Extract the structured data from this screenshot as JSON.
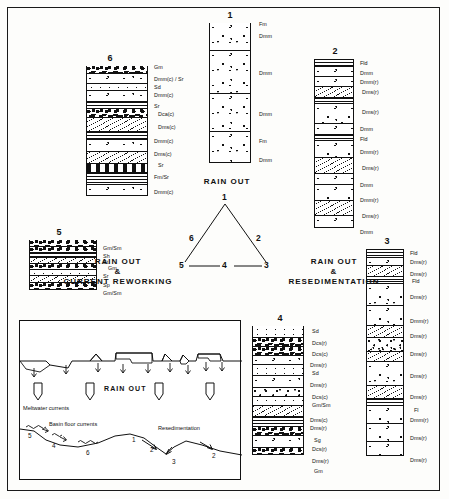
{
  "figure": {
    "title_visible": false
  },
  "columns": [
    {
      "id": "col1",
      "number": "1",
      "labels": [
        "Fm",
        "Dmm",
        "Dmm",
        "Dmm",
        "Fm",
        "Dmm"
      ]
    },
    {
      "id": "col2",
      "number": "2",
      "labels": [
        "Fld",
        "Dmm",
        "Dmm(r)",
        "Dms(r)",
        "Dms(r)",
        "Dmm",
        "Fld",
        "Dmm(r)",
        "Dms(r)",
        "Dmm",
        "Dmm(r)",
        "Dms(r)",
        "Dmm"
      ]
    },
    {
      "id": "col3",
      "number": "3",
      "labels": [
        "Fld",
        "Dms(r)",
        "Dms(r)",
        "Fld",
        "Dms(r)",
        "Dmm(r)",
        "Dms(r)",
        "Dms(r)",
        "Dms(r)",
        "Dms(r)",
        "Fl",
        "Dmm(r)",
        "Dms(r)",
        "Dms(r)"
      ]
    },
    {
      "id": "col4",
      "number": "4",
      "labels": [
        "Sd",
        "Dcs(r)",
        "Dcs(c)",
        "Dms(r)",
        "Sd",
        "Dms(r)",
        "Dcs(c)",
        "Gm/Sm",
        "Dms(c)",
        "Dms(r)",
        "Sg",
        "Dcs(r)",
        "Dms(r)",
        "Gm"
      ]
    },
    {
      "id": "col5",
      "number": "5",
      "labels": [
        "Gm/Sm",
        "Sh",
        "St",
        "Gm",
        "Sr",
        "Sp",
        "Gm/Sm"
      ]
    },
    {
      "id": "col6",
      "number": "6",
      "labels": [
        "Gm",
        "Dmm(c) / Sr",
        "Sd",
        "Dmm(c)",
        "Sr",
        "Dca(c)",
        "Dms(c)",
        "Dmm(c)",
        "Dms(c)",
        "Sr",
        "Fm/Sr",
        "Dmm(c)"
      ]
    }
  ],
  "triangle": {
    "apex_caption": "RAIN OUT",
    "left_caption_line1": "RAIN OUT",
    "left_caption_line2": "&",
    "left_caption_line3": "CURRENT REWORKING",
    "right_caption_line1": "RAIN OUT",
    "right_caption_line2": "&",
    "right_caption_line3": "RESEDIMENTATION",
    "nodes": {
      "apex": "1",
      "upper_left": "6",
      "upper_right": "2",
      "bottom_left": "5",
      "bottom_mid": "4",
      "bottom_right": "3"
    }
  },
  "panel": {
    "rain_out_label": "RAIN OUT",
    "meltwater_label": "Meltwater currents",
    "basin_floor_label": "Basin floor currents",
    "resedimentation_label": "Resedimentation",
    "numbers": {
      "n5": "5",
      "n4": "4",
      "n6": "6",
      "n1": "1",
      "n2a": "2",
      "n3": "3",
      "n2b": "2"
    }
  },
  "colors": {
    "ink": "#111111",
    "paper": "#ffffff"
  }
}
